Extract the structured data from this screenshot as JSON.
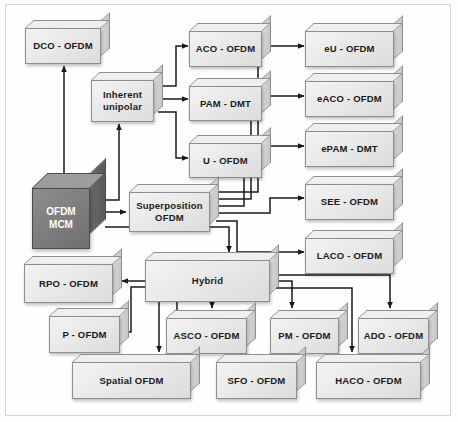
{
  "diagram": {
    "background_color": "#fdfdfd",
    "frame_border_color": "#d8d8d8",
    "box_fill_color": "#e9e9e9",
    "box_border_color": "#8e8e8e",
    "root_fill_color": "#7e7e7e",
    "root_text_color": "#ffffff",
    "arrow_color": "#1a1a1a"
  },
  "nodes": {
    "root": {
      "label": "OFDM\nMCM"
    },
    "dco": {
      "label": "DCO - OFDM"
    },
    "inherent": {
      "label": "Inherent\nunipolar"
    },
    "aco": {
      "label": "ACO - OFDM"
    },
    "pam": {
      "label": "PAM - DMT"
    },
    "u": {
      "label": "U - OFDM"
    },
    "eu": {
      "label": "eU - OFDM"
    },
    "eaco": {
      "label": "eACO - OFDM"
    },
    "epam": {
      "label": "ePAM - DMT"
    },
    "see": {
      "label": "SEE - OFDM"
    },
    "laco": {
      "label": "LACO - OFDM"
    },
    "superposition": {
      "label": "Superposition\nOFDM"
    },
    "hybrid": {
      "label": "Hybrid"
    },
    "rpo": {
      "label": "RPO - OFDM"
    },
    "p": {
      "label": "P - OFDM"
    },
    "asco": {
      "label": "ASCO - OFDM"
    },
    "pm": {
      "label": "PM - OFDM"
    },
    "ado": {
      "label": "ADO - OFDM"
    },
    "spatial": {
      "label": "Spatial OFDM"
    },
    "sfo": {
      "label": "SFO - OFDM"
    },
    "haco": {
      "label": "HACO - OFDM"
    }
  },
  "edges": [
    {
      "from": "root",
      "to": "dco"
    },
    {
      "from": "root",
      "to": "inherent"
    },
    {
      "from": "root",
      "to": "superposition"
    },
    {
      "from": "root",
      "to": "hybrid"
    },
    {
      "from": "inherent",
      "to": "aco"
    },
    {
      "from": "inherent",
      "to": "pam"
    },
    {
      "from": "inherent",
      "to": "u"
    },
    {
      "from": "superposition",
      "to": "eu"
    },
    {
      "from": "superposition",
      "to": "eaco"
    },
    {
      "from": "superposition",
      "to": "epam"
    },
    {
      "from": "superposition",
      "to": "see"
    },
    {
      "from": "superposition",
      "to": "laco"
    },
    {
      "from": "hybrid",
      "to": "rpo"
    },
    {
      "from": "hybrid",
      "to": "p"
    },
    {
      "from": "hybrid",
      "to": "asco"
    },
    {
      "from": "hybrid",
      "to": "pm"
    },
    {
      "from": "hybrid",
      "to": "ado"
    },
    {
      "from": "hybrid",
      "to": "spatial"
    },
    {
      "from": "hybrid",
      "to": "sfo"
    },
    {
      "from": "hybrid",
      "to": "haco"
    }
  ]
}
